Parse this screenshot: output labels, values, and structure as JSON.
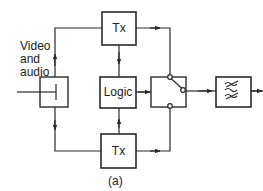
{
  "diagram": {
    "input_label": [
      "Video",
      "and",
      "audio"
    ],
    "blocks": {
      "tx_top": "Tx",
      "logic": "Logic",
      "tx_bottom": "Tx",
      "splitter": "",
      "switch": "",
      "filter": ""
    },
    "caption": "(a)",
    "colors": {
      "line": "#2a2a2a",
      "background": "#ffffff"
    }
  }
}
